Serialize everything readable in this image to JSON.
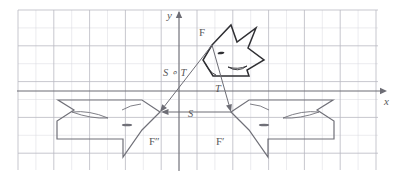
{
  "figure": {
    "type": "geometry-diagram",
    "background_color": "#ffffff",
    "grid_color": "#d8d8de",
    "grid_major_color": "#b9b9c2",
    "axis_color": "#6d6d75",
    "shape_stroke_dark": "#2f2f33",
    "shape_stroke_gray": "#707078",
    "label_color": "#5a5a5a"
  },
  "axes": {
    "x_label": "x",
    "y_label": "y",
    "x_axis_y_px": 91,
    "y_axis_x_px": 179,
    "grid": {
      "left": 18,
      "top": 10,
      "right": 378,
      "bottom": 170,
      "cell_size": 17.9,
      "visible": true
    }
  },
  "shapes": [
    {
      "name": "F",
      "label": "F",
      "label_pos": {
        "x": 199,
        "y": 36
      },
      "stroke": "#2f2f33",
      "stroke_width": 1.5,
      "points": "212,45 231,25 237,42 256,28 248,48 264,60 247,70 249,76 213,76 203,60",
      "eye": {
        "cx": 221,
        "cy": 53,
        "rx": 3.4,
        "ry": 1.2,
        "angle": -8
      },
      "fin": {
        "path": "M 228,67 Q 238,70 247,66 Q 238,73 228,67"
      },
      "mouth": {
        "path": "M 205,63 Q 209,72 216,75"
      }
    },
    {
      "name": "F-prime",
      "label": "F′",
      "label_pos": {
        "x": 216,
        "y": 145
      },
      "stroke": "#707078",
      "stroke_width": 1.2,
      "points": "231,112 249,100 333,100 317,110 334,121 334,139 268,139 268,157 249,130",
      "eye": {
        "cx": 264,
        "cy": 125,
        "rx": 5.2,
        "ry": 1.3,
        "angle": 0
      },
      "fin": {
        "path": "M 283,118 Q 302,110 319,112 Q 300,119 283,118"
      },
      "mouth": {
        "path": "M 250,104 Q 261,105 269,110"
      }
    },
    {
      "name": "F-double-prime",
      "label": "F″",
      "label_pos": {
        "x": 149,
        "y": 145
      },
      "stroke": "#707078",
      "stroke_width": 1.2,
      "points": "160,112 142,100 58,100 74,110 57,121 57,139 123,139 123,157 142,130",
      "eye": {
        "cx": 127,
        "cy": 125,
        "rx": 5.2,
        "ry": 1.3,
        "angle": 0
      },
      "fin": {
        "path": "M 108,118 Q 89,110 72,112 Q 91,119 108,118"
      },
      "mouth": {
        "path": "M 141,104 Q 130,105 122,110"
      }
    }
  ],
  "arrows": [
    {
      "name": "arrow-T",
      "label": "T",
      "label_pos": {
        "x": 215,
        "y": 92
      },
      "from": {
        "x": 212,
        "y": 45
      },
      "to": {
        "x": 231,
        "y": 112
      },
      "stroke": "#6d6d75"
    },
    {
      "name": "arrow-S-compose-T",
      "label": "S ∘ T",
      "label_pos": {
        "x": 163,
        "y": 76
      },
      "from": {
        "x": 212,
        "y": 45
      },
      "to": {
        "x": 160,
        "y": 112
      },
      "stroke": "#6d6d75"
    },
    {
      "name": "arrow-S",
      "label": "S",
      "label_pos": {
        "x": 188,
        "y": 117
      },
      "from": {
        "x": 231,
        "y": 112
      },
      "to": {
        "x": 161,
        "y": 112
      },
      "stroke": "#6d6d75"
    }
  ]
}
